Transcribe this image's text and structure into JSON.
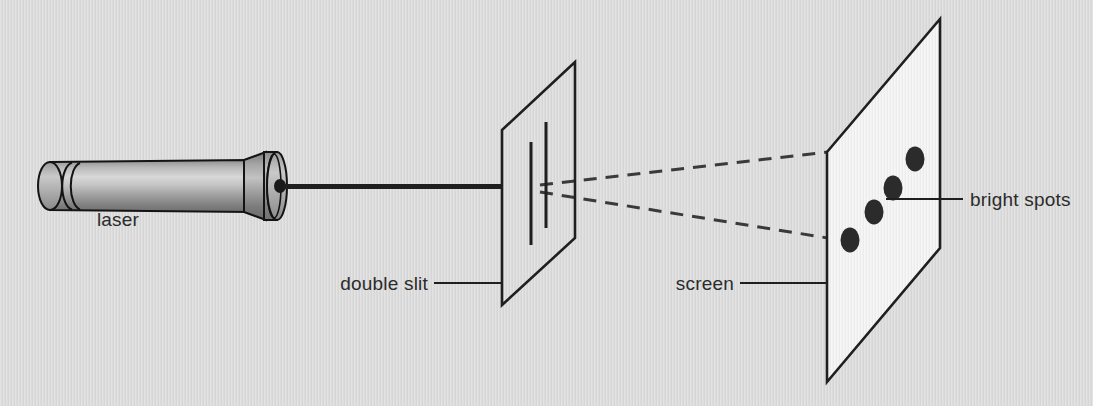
{
  "figure": {
    "background_color": "#dcdcdc",
    "panel_color": "#f2f2f2",
    "line_color": "#1f1f1f",
    "spot_color": "#2b2b2b"
  },
  "labels": {
    "laser": "laser",
    "double_slit": "double slit",
    "screen": "screen",
    "bright_spots": "bright spots"
  },
  "diagram_data": {
    "type": "diagram",
    "components": [
      {
        "name": "laser",
        "label": "laser",
        "shape": "cylinder",
        "body": {
          "x": 38,
          "y": 162,
          "width": 205,
          "height": 48
        },
        "tip": {
          "x": 243,
          "y": 156,
          "width": 45,
          "height": 60
        },
        "aperture": {
          "cx": 281,
          "cy": 186,
          "rx": 6,
          "ry": 7
        }
      },
      {
        "name": "beam",
        "label": "laser beam",
        "from": [
          288,
          186
        ],
        "to": [
          503,
          186
        ],
        "stroke_width": 5,
        "style": "solid"
      },
      {
        "name": "double-slit",
        "label": "double slit",
        "shape": "parallelogram",
        "points": [
          [
            502,
            130
          ],
          [
            575,
            62
          ],
          [
            575,
            238
          ],
          [
            502,
            305
          ]
        ],
        "filled": false,
        "slits": [
          {
            "x": 531,
            "y1": 142,
            "y2": 245
          },
          {
            "x": 546,
            "y1": 122,
            "y2": 228
          }
        ]
      },
      {
        "name": "screen",
        "label": "screen",
        "shape": "parallelogram",
        "points": [
          [
            827,
            152
          ],
          [
            940,
            19
          ],
          [
            940,
            248
          ],
          [
            827,
            382
          ]
        ],
        "filled": true,
        "fill": "#f2f2f2"
      },
      {
        "name": "diffracted-rays",
        "label": "diffracted light rays",
        "style": "dashed",
        "rays": [
          {
            "from": [
              546,
              186
            ],
            "to": [
              827,
              152
            ]
          },
          {
            "from": [
              546,
              192
            ],
            "to": [
              827,
              238
            ]
          }
        ]
      },
      {
        "name": "bright-spots",
        "label": "bright spots",
        "count": 4,
        "shape": "ellipse",
        "rx": 9,
        "ry": 12,
        "positions": [
          [
            850,
            240
          ],
          [
            874,
            212
          ],
          [
            893,
            188
          ],
          [
            915,
            159
          ]
        ]
      }
    ],
    "leader_lines": [
      {
        "name": "double-slit-leader",
        "from": [
          435,
          283
        ],
        "to": [
          502,
          283
        ],
        "elbow_to": [
          502,
          305
        ]
      },
      {
        "name": "screen-leader",
        "from": [
          740,
          283
        ],
        "to": [
          827,
          283
        ]
      },
      {
        "name": "bright-spots-leader",
        "from": [
          886,
          199
        ],
        "to": [
          962,
          199
        ]
      }
    ],
    "label_positions": {
      "laser": [
        118,
        226
      ],
      "double_slit": [
        330,
        290
      ],
      "screen": [
        676,
        290
      ],
      "bright_spots": [
        970,
        206
      ]
    }
  }
}
